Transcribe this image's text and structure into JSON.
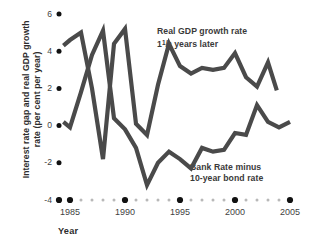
{
  "chart_data": {
    "type": "line",
    "title": "",
    "xlabel": "Year",
    "ylabel": "Interest rate gap and real GDP growth rate (per cent per year)",
    "ylabel_line1": "Interest rate gap and real GDP growth",
    "ylabel_line2": "rate (per cent per year)",
    "xlim": [
      1983.6,
      2005.5
    ],
    "ylim": [
      -4,
      6
    ],
    "yticks": [
      6,
      4,
      2,
      0,
      -2,
      -4
    ],
    "ytick_labels": [
      "6",
      "4",
      "2",
      "0",
      "-2",
      "-4"
    ],
    "xticks": [
      1985,
      1990,
      1995,
      2000,
      2005
    ],
    "xtick_labels": [
      "1985",
      "1990",
      "1995",
      "2000",
      "2005"
    ],
    "grid": false,
    "legend_position": "inline-annotation",
    "line_color": "#4a4a4a",
    "line_width": 4.2,
    "axis_dot_color": "#111111",
    "minor_dot_color": "#b8b8b8",
    "annotations": [
      {
        "name": "real-gdp-growth-rate-annotation",
        "line1": "Real GDP growth rate",
        "line2_prefix": "1",
        "line2_fraction_num": "1",
        "line2_fraction_den": "2",
        "line2_suffix": " years later"
      },
      {
        "name": "bank-rate-minus-bond-rate-annotation",
        "line1": "Bank Rate minus",
        "line2": "10-year bond rate"
      }
    ],
    "series": [
      {
        "name": "Real GDP growth rate 1 1/2 years later",
        "color": "#4a4a4a",
        "x": [
          1984.4,
          1985.0,
          1986.0,
          1987.0,
          1988.0,
          1989.0,
          1990.0,
          1991.0,
          1992.0,
          1993.0,
          1994.0,
          1995.0,
          1996.0,
          1997.0,
          1998.0,
          1999.0,
          2000.0,
          2001.0,
          2002.0,
          2003.0,
          2003.8
        ],
        "values": [
          4.3,
          4.6,
          5.0,
          2.0,
          -1.8,
          4.4,
          5.2,
          0.1,
          -0.5,
          2.2,
          4.4,
          3.2,
          2.8,
          3.1,
          3.0,
          3.1,
          3.9,
          2.6,
          2.1,
          3.4,
          1.9
        ],
        "label": "Real GDP growth rate 1½ years later"
      },
      {
        "name": "Bank Rate minus 10-year bond rate",
        "color": "#4a4a4a",
        "x": [
          1984.4,
          1985.0,
          1986.0,
          1987.0,
          1988.0,
          1989.0,
          1990.0,
          1991.0,
          1992.0,
          1993.0,
          1994.0,
          1995.0,
          1996.0,
          1997.0,
          1998.0,
          1999.0,
          2000.0,
          2001.0,
          2002.0,
          2003.0,
          2004.0,
          2005.0
        ],
        "values": [
          0.2,
          -0.1,
          1.8,
          3.8,
          5.1,
          0.4,
          -0.2,
          -1.2,
          -3.2,
          -2.0,
          -1.4,
          -1.8,
          -2.3,
          -1.2,
          -1.4,
          -1.3,
          -0.4,
          -0.5,
          1.1,
          0.2,
          -0.1,
          0.2
        ],
        "label": "Bank Rate minus 10-year bond rate"
      }
    ]
  }
}
